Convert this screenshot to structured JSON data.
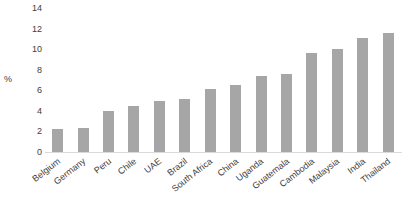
{
  "chart_data": {
    "type": "bar",
    "title": "",
    "xlabel": "",
    "ylabel": "%",
    "ylim": [
      0,
      14
    ],
    "yticks": [
      0,
      2,
      4,
      6,
      8,
      10,
      12,
      14
    ],
    "grid": false,
    "legend": "none",
    "bar_color": "#a6a6a6",
    "categories": [
      "Belgium",
      "Germany",
      "Peru",
      "Chile",
      "UAE",
      "Brazil",
      "South Africa",
      "China",
      "Uganda",
      "Guatemala",
      "Cambodia",
      "Malaysia",
      "India",
      "Thailand"
    ],
    "values": [
      2.2,
      2.3,
      4.0,
      4.5,
      5.0,
      5.2,
      6.1,
      6.5,
      7.4,
      7.6,
      9.6,
      10.0,
      11.1,
      11.6
    ]
  }
}
